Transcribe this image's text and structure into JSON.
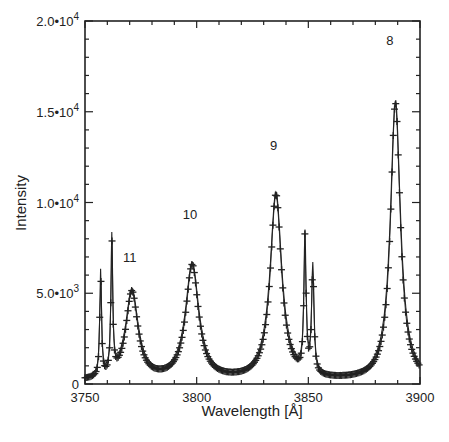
{
  "chart_data": {
    "type": "line",
    "title": "",
    "xlabel": "Wavelength [Å]",
    "ylabel": "Intensity",
    "xlim": [
      3750,
      3900
    ],
    "ylim": [
      0,
      20000
    ],
    "grid": false,
    "legend": null,
    "x_ticks": [
      {
        "value": 3750,
        "label": "3750"
      },
      {
        "value": 3800,
        "label": "3800"
      },
      {
        "value": 3850,
        "label": "3850"
      },
      {
        "value": 3900,
        "label": "3900"
      }
    ],
    "x_minor_step": 10,
    "y_ticks": [
      {
        "value": 0,
        "label": "0",
        "sup": ""
      },
      {
        "value": 5000,
        "label": "5.0•10",
        "sup": "3"
      },
      {
        "value": 10000,
        "label": "1.0•10",
        "sup": "4"
      },
      {
        "value": 15000,
        "label": "1.5•10",
        "sup": "4"
      },
      {
        "value": 20000,
        "label": "2.0•10",
        "sup": "4"
      }
    ],
    "y_minor_step": 1000,
    "annotations": [
      {
        "text": "11",
        "x": 3770,
        "y": 6700
      },
      {
        "text": "10",
        "x": 3797,
        "y": 9100
      },
      {
        "text": "9",
        "x": 3834.5,
        "y": 12900
      },
      {
        "text": "8",
        "x": 3886.5,
        "y": 18700
      }
    ],
    "series": [
      {
        "name": "observed (crosses)",
        "style": "markers+line",
        "marker": "plus",
        "peaks": [
          {
            "label": "H11",
            "center": 3771,
            "intensity": 4850,
            "width": 3.2
          },
          {
            "label": "H10",
            "center": 3798,
            "intensity": 6300,
            "width": 3.4
          },
          {
            "label": "H9",
            "center": 3835.5,
            "intensity": 10200,
            "width": 3.0
          },
          {
            "label": "H8",
            "center": 3889,
            "intensity": 15300,
            "width": 2.6
          },
          {
            "label": "line",
            "center": 3757,
            "intensity": 5700,
            "width": 0.45
          },
          {
            "label": "line",
            "center": 3762,
            "intensity": 7400,
            "width": 0.45
          },
          {
            "label": "line",
            "center": 3848.5,
            "intensity": 7400,
            "width": 0.55
          },
          {
            "label": "line",
            "center": 3852,
            "intensity": 5800,
            "width": 0.6
          }
        ],
        "baseline": 600,
        "approx_points": [
          [
            3750,
            5200
          ],
          [
            3754,
            3300
          ],
          [
            3757,
            5700
          ],
          [
            3760,
            3000
          ],
          [
            3762,
            7400
          ],
          [
            3766,
            2700
          ],
          [
            3771,
            4850
          ],
          [
            3776,
            3000
          ],
          [
            3785,
            1200
          ],
          [
            3792,
            1700
          ],
          [
            3798,
            6300
          ],
          [
            3804,
            2800
          ],
          [
            3812,
            1200
          ],
          [
            3820,
            750
          ],
          [
            3828,
            1600
          ],
          [
            3835.5,
            10200
          ],
          [
            3842,
            2500
          ],
          [
            3846,
            1400
          ],
          [
            3848.5,
            7400
          ],
          [
            3852,
            5800
          ],
          [
            3856,
            1200
          ],
          [
            3865,
            800
          ],
          [
            3878,
            1500
          ],
          [
            3884,
            4000
          ],
          [
            3889,
            15300
          ],
          [
            3893,
            5000
          ],
          [
            3898,
            700
          ],
          [
            3900,
            300
          ]
        ]
      },
      {
        "name": "fit (solid line)",
        "style": "line",
        "note": "smooth Lorentzian fit closely following observed profile; slightly higher on far wing near 3900"
      }
    ]
  },
  "colors": {
    "background": "#ffffff",
    "ink": "#222222"
  }
}
